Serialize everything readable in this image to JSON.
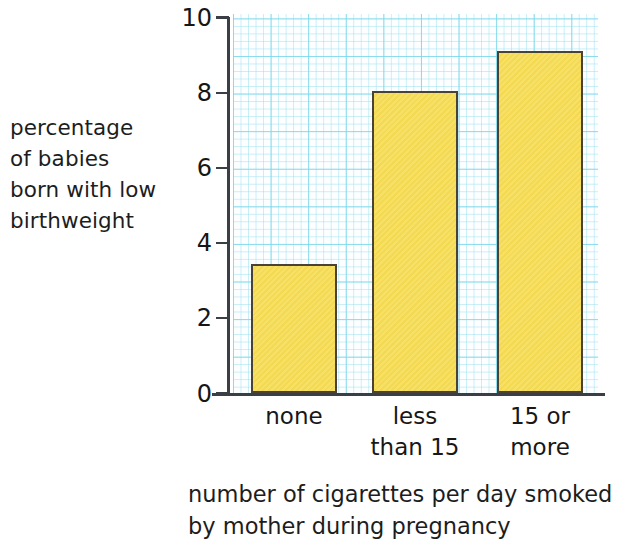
{
  "chart_data": {
    "type": "bar",
    "title": "",
    "subtitle": "",
    "categories": [
      "none",
      "less\nthan 15",
      "15 or\nmore"
    ],
    "values": [
      3.45,
      8.05,
      9.1
    ],
    "xlabel": "number of cigarettes per day smoked\nby mother during pregnancy",
    "ylabel": "percentage\nof babies\nborn with low\nbirthweight",
    "ylim": [
      0,
      10
    ],
    "y_ticks": [
      "0",
      "2",
      "4",
      "6",
      "8",
      "10"
    ],
    "y_tick_values": [
      0,
      2,
      4,
      6,
      8,
      10
    ],
    "grid": true,
    "grid_style": "graph-paper",
    "legend": "none",
    "colors": {
      "bar_fill": "#F7DD55",
      "bar_border": "#4A4236",
      "grid_minor": "#99E0EE",
      "grid_major": "#78D6E9",
      "axis": "#3A3F46",
      "text": "#1B1B1B",
      "background": "#FFFFFF"
    }
  }
}
